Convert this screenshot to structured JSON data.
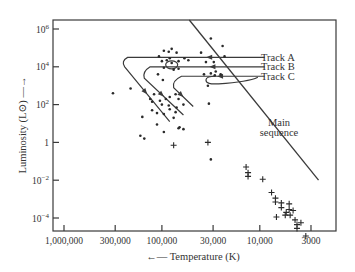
{
  "chart_data": {
    "type": "scatter",
    "title": "",
    "xlabel": "Temperature (K)",
    "ylabel": "Luminosity (L⊙)",
    "x_scale": "log, reversed",
    "y_scale": "log",
    "xlim": [
      1500000,
      2000
    ],
    "ylim": [
      3e-05,
      1500000
    ],
    "x_ticks": [
      {
        "value": 1000000,
        "label": "1,000,000"
      },
      {
        "value": 300000,
        "label": "300,000"
      },
      {
        "value": 100000,
        "label": "100,000"
      },
      {
        "value": 30000,
        "label": "30,000"
      },
      {
        "value": 10000,
        "label": "10,000"
      },
      {
        "value": 3000,
        "label": "3000"
      }
    ],
    "y_ticks": [
      {
        "value": 1000000,
        "base": "10",
        "exp": "6"
      },
      {
        "value": 10000,
        "base": "10",
        "exp": "4"
      },
      {
        "value": 100,
        "base": "10",
        "exp": "2"
      },
      {
        "value": 1,
        "base": "1",
        "exp": ""
      },
      {
        "value": 0.01,
        "base": "10",
        "exp": "−2"
      },
      {
        "value": 0.0001,
        "base": "10",
        "exp": "−4"
      }
    ],
    "grid": false,
    "legend": "none",
    "annotations": [
      {
        "text": "Track A",
        "logT": 4.02,
        "logL": 4.5
      },
      {
        "text": "Track B",
        "logT": 4.02,
        "logL": 4.0
      },
      {
        "text": "Track C",
        "logT": 4.02,
        "logL": 3.5
      },
      {
        "text": "Main",
        "logT": 3.83,
        "logL": 1.05
      },
      {
        "text": "sequence",
        "logT": 3.83,
        "logL": 0.5
      }
    ],
    "main_sequence": {
      "name": "Main sequence",
      "from": {
        "logT": 4.72,
        "logL": 6.5
      },
      "to": {
        "logT": 3.4,
        "logL": -2.0
      }
    },
    "tracks": [
      {
        "name": "Track A",
        "points": [
          [
            3.95,
            4.5
          ],
          [
            5.05,
            4.5
          ],
          [
            5.35,
            4.5
          ],
          [
            5.42,
            4.3
          ],
          [
            5.38,
            4.0
          ],
          [
            4.92,
            1.1
          ]
        ]
      },
      {
        "name": "Track B",
        "points": [
          [
            3.95,
            4.0
          ],
          [
            4.7,
            4.0
          ],
          [
            5.12,
            4.0
          ],
          [
            5.2,
            3.75
          ],
          [
            5.18,
            3.4
          ],
          [
            4.78,
            1.45
          ]
        ]
      },
      {
        "name": "Track C",
        "points": [
          [
            3.95,
            3.5
          ],
          [
            4.45,
            3.5
          ],
          [
            4.8,
            3.5
          ],
          [
            4.9,
            3.25
          ],
          [
            4.88,
            2.9
          ],
          [
            4.68,
            1.9
          ]
        ]
      }
    ],
    "series": [
      {
        "name": "Planetary nebula nuclei",
        "marker": "dot",
        "points": [
          [
            4.9,
            4.95
          ],
          [
            4.98,
            4.85
          ],
          [
            4.85,
            4.75
          ],
          [
            4.93,
            4.8
          ],
          [
            4.6,
            4.75
          ],
          [
            4.5,
            5.5
          ],
          [
            4.38,
            5.1
          ],
          [
            5.03,
            4.55
          ],
          [
            5.0,
            4.3
          ],
          [
            4.95,
            4.35
          ],
          [
            4.9,
            4.2
          ],
          [
            4.83,
            4.3
          ],
          [
            4.73,
            4.35
          ],
          [
            4.92,
            4.45
          ],
          [
            4.77,
            4.45
          ],
          [
            4.55,
            4.25
          ],
          [
            4.47,
            4.25
          ],
          [
            4.36,
            4.55
          ],
          [
            4.98,
            3.95
          ],
          [
            4.88,
            3.85
          ],
          [
            4.83,
            3.9
          ],
          [
            4.99,
            3.3
          ],
          [
            5.04,
            3.6
          ],
          [
            4.57,
            3.6
          ],
          [
            4.4,
            3.6
          ],
          [
            4.46,
            3.55
          ],
          [
            4.5,
            3.65
          ],
          [
            4.45,
            3.75
          ],
          [
            4.53,
            3.0
          ],
          [
            5.5,
            2.6
          ],
          [
            5.32,
            2.85
          ],
          [
            5.08,
            2.55
          ],
          [
            5.12,
            2.3
          ],
          [
            5.1,
            2.15
          ],
          [
            5.02,
            2.2
          ],
          [
            4.96,
            2.3
          ],
          [
            4.92,
            2.4
          ],
          [
            4.86,
            2.55
          ],
          [
            5.0,
            2.0
          ],
          [
            4.93,
            1.95
          ],
          [
            4.85,
            1.85
          ],
          [
            5.1,
            1.7
          ],
          [
            5.05,
            1.55
          ],
          [
            4.98,
            1.5
          ],
          [
            4.92,
            1.75
          ],
          [
            4.88,
            1.3
          ],
          [
            4.86,
            1.6
          ],
          [
            4.78,
            2.0
          ],
          [
            4.83,
            2.3
          ],
          [
            5.05,
            0.95
          ],
          [
            5.2,
            1.35
          ],
          [
            5.22,
            0.35
          ],
          [
            5.18,
            0.2
          ],
          [
            4.98,
            0.55
          ],
          [
            4.82,
            0.8
          ],
          [
            4.78,
            0.7
          ],
          [
            4.83,
            0.75
          ],
          [
            4.52,
            2.05
          ],
          [
            4.5,
            -0.9
          ]
        ]
      },
      {
        "name": "White dwarfs",
        "marker": "plus",
        "points": [
          [
            4.88,
            -0.15
          ],
          [
            4.53,
            -0.0
          ],
          [
            4.14,
            -1.3
          ],
          [
            4.12,
            -1.6
          ],
          [
            4.12,
            -1.8
          ],
          [
            3.97,
            -1.95
          ],
          [
            3.88,
            -2.65
          ],
          [
            3.84,
            -2.95
          ],
          [
            3.84,
            -3.15
          ],
          [
            3.78,
            -3.2
          ],
          [
            3.78,
            -3.45
          ],
          [
            3.73,
            -3.7
          ],
          [
            3.69,
            -3.85
          ],
          [
            3.74,
            -3.85
          ],
          [
            3.83,
            -3.95
          ],
          [
            3.7,
            -3.55
          ],
          [
            3.7,
            -3.25
          ],
          [
            3.66,
            -3.6
          ],
          [
            3.64,
            -4.1
          ],
          [
            3.62,
            -4.35
          ],
          [
            3.62,
            -4.55
          ],
          [
            3.58,
            -4.25
          ],
          [
            3.53,
            -4.95
          ]
        ]
      }
    ]
  }
}
